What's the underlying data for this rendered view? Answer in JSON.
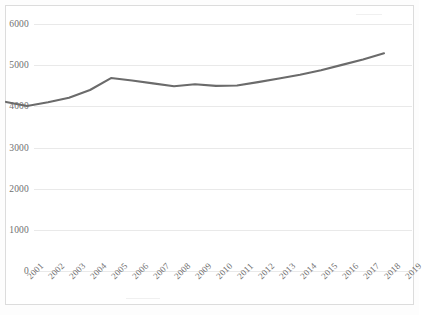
{
  "chart_data": {
    "type": "line",
    "title": "",
    "subtitle": "",
    "xlabel": "",
    "ylabel": "",
    "categories": [
      "2001",
      "2002",
      "2003",
      "2004",
      "2005",
      "2006",
      "2007",
      "2008",
      "2009",
      "2010",
      "2011",
      "2012",
      "2013",
      "2014",
      "2015",
      "2016",
      "2017",
      "2018",
      "2019"
    ],
    "series": [
      {
        "name": "",
        "color": "#6b6b6b",
        "values": [
          3670,
          3570,
          3660,
          3770,
          3960,
          4250,
          4190,
          4120,
          4050,
          4100,
          4060,
          4070,
          4150,
          4240,
          4330,
          4440,
          4570,
          4700,
          4850
        ]
      }
    ],
    "ylim": [
      0,
      6000
    ],
    "yticks": [
      0,
      1000,
      2000,
      3000,
      4000,
      5000,
      6000
    ],
    "ytick_labels": [
      "0",
      "1000",
      "2000",
      "3000",
      "4000",
      "5000",
      "6000"
    ],
    "grid": true,
    "grid_axis": "y",
    "legend": false,
    "legend_position": "none",
    "markers": false,
    "xtick_rotation": -45
  },
  "style": {
    "line_color": "#6b6b6b",
    "grid_color": "#e9e9e9",
    "tick_text_color": "#6f6f6f",
    "frame_border_color": "#dcdcdc",
    "background_color": "#ffffff"
  }
}
